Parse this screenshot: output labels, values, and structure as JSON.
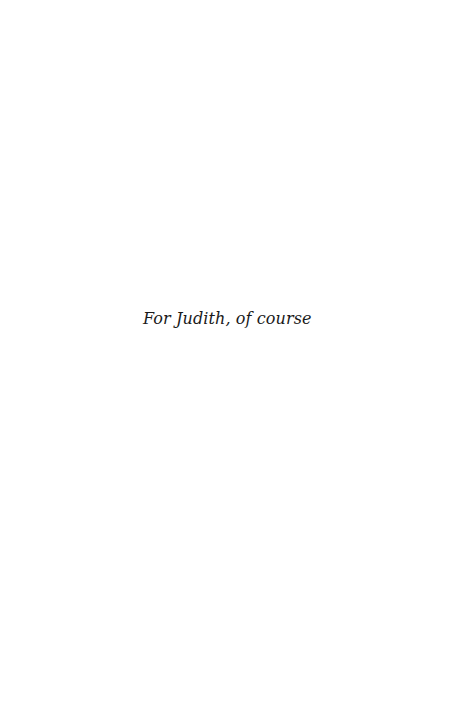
{
  "page": {
    "dedication": "For Judith, of course"
  }
}
